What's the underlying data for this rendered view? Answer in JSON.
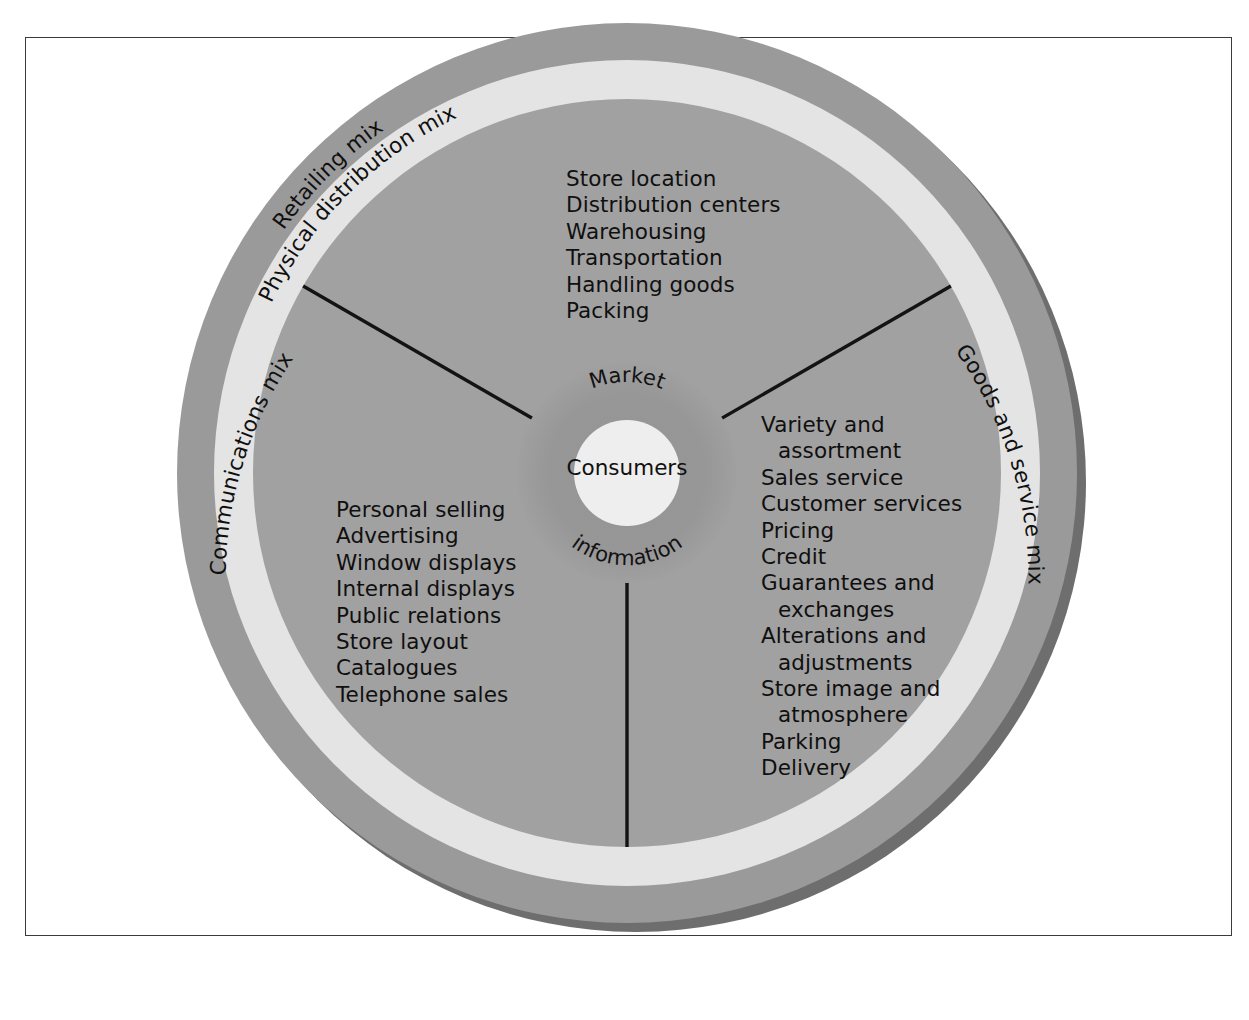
{
  "diagram": {
    "center": {
      "core_label": "Consumers",
      "hub_label_top": "Market",
      "hub_label_bottom": "information"
    },
    "outer_ring": {
      "label": "Retailing mix"
    },
    "mid_ring": {
      "labels": {
        "top": "Physical distribution mix",
        "left": "Communications mix",
        "right": "Goods and service mix"
      }
    },
    "sectors": [
      {
        "name": "physical-distribution",
        "ring_label": "Physical distribution mix",
        "items": [
          {
            "text": "Store location",
            "indent": false
          },
          {
            "text": "Distribution centers",
            "indent": false
          },
          {
            "text": "Warehousing",
            "indent": false
          },
          {
            "text": "Transportation",
            "indent": false
          },
          {
            "text": "Handling goods",
            "indent": false
          },
          {
            "text": "Packing",
            "indent": false
          }
        ]
      },
      {
        "name": "goods-and-service",
        "ring_label": "Goods and service mix",
        "items": [
          {
            "text": "Variety and",
            "indent": false
          },
          {
            "text": "assortment",
            "indent": true
          },
          {
            "text": "Sales service",
            "indent": false
          },
          {
            "text": "Customer services",
            "indent": false
          },
          {
            "text": "Pricing",
            "indent": false
          },
          {
            "text": "Credit",
            "indent": false
          },
          {
            "text": "Guarantees and",
            "indent": false
          },
          {
            "text": "exchanges",
            "indent": true
          },
          {
            "text": "Alterations and",
            "indent": false
          },
          {
            "text": "adjustments",
            "indent": true
          },
          {
            "text": "Store image and",
            "indent": false
          },
          {
            "text": "atmosphere",
            "indent": true
          },
          {
            "text": "Parking",
            "indent": false
          },
          {
            "text": "Delivery",
            "indent": false
          }
        ]
      },
      {
        "name": "communications",
        "ring_label": "Communications mix",
        "items": [
          {
            "text": "Personal selling",
            "indent": false
          },
          {
            "text": "Advertising",
            "indent": false
          },
          {
            "text": "Window displays",
            "indent": false
          },
          {
            "text": "Internal displays",
            "indent": false
          },
          {
            "text": "Public relations",
            "indent": false
          },
          {
            "text": "Store layout",
            "indent": false
          },
          {
            "text": "Catalogues",
            "indent": false
          },
          {
            "text": "Telephone sales",
            "indent": false
          }
        ]
      }
    ],
    "colors": {
      "outer_ring": "#9a9a9a",
      "mid_ring": "#e2e2e2",
      "inner_disc": "#a0a0a0",
      "hub_disc": "#969696",
      "core_circle": "#ededed",
      "divider": "#131313",
      "shadow": "#6e6e6e",
      "frame_border": "#3b3b3b",
      "text": "#100f0f",
      "page_background": "#ffffff"
    },
    "geometry": {
      "center_x": 627,
      "center_y": 473,
      "outer_radius": 450,
      "mid_ring_outer_radius": 413,
      "mid_ring_inner_radius": 374,
      "hub_radius": 110,
      "core_radius": 53
    }
  }
}
